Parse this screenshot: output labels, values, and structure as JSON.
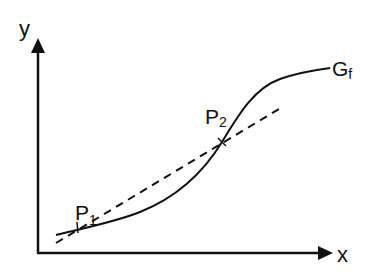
{
  "diagram": {
    "axes": {
      "x_label": "x",
      "y_label": "y"
    },
    "curve": {
      "label_main": "G",
      "label_sub": "f"
    },
    "points": [
      {
        "label_main": "P",
        "label_sub": "1"
      },
      {
        "label_main": "P",
        "label_sub": "2"
      }
    ],
    "secant_line": {
      "style": "dashed"
    },
    "colors": {
      "stroke": "#111111",
      "background": "#ffffff"
    }
  }
}
